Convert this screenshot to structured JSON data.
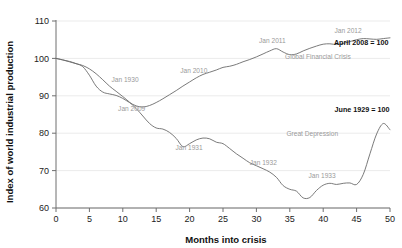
{
  "chart_data": {
    "type": "line",
    "title": "",
    "xlabel": "Months into crisis",
    "ylabel": "Index of world industrial production",
    "xlim": [
      0,
      50
    ],
    "ylim": [
      60,
      110
    ],
    "grid": true,
    "legend_position": "inline-annotations",
    "xticks": [
      "0",
      "5",
      "10",
      "15",
      "20",
      "25",
      "30",
      "35",
      "40",
      "45",
      "50"
    ],
    "yticks": [
      "60",
      "70",
      "80",
      "90",
      "100",
      "110"
    ],
    "series": [
      {
        "name": "Global Financial Crisis",
        "baseline_label": "April 2008 = 100",
        "color": "#6b6b6b",
        "x": [
          0,
          1,
          2,
          3,
          4,
          5,
          6,
          7,
          8,
          9,
          10,
          11,
          12,
          13,
          14,
          15,
          16,
          17,
          18,
          19,
          20,
          21,
          22,
          23,
          24,
          25,
          26,
          27,
          28,
          29,
          30,
          31,
          32,
          33,
          34,
          35,
          36,
          37,
          38,
          39,
          40,
          41,
          42,
          43,
          44,
          45,
          46,
          47,
          48,
          49,
          50
        ],
        "values": [
          100.0,
          99.6,
          99.2,
          98.6,
          97.8,
          95.5,
          92.6,
          91.0,
          90.5,
          90.1,
          89.3,
          88.2,
          87.3,
          87.0,
          87.4,
          88.2,
          89.2,
          90.3,
          91.4,
          92.6,
          93.7,
          94.8,
          95.7,
          96.3,
          96.9,
          97.6,
          97.9,
          98.4,
          99.1,
          99.7,
          100.4,
          101.2,
          102.0,
          102.6,
          101.7,
          101.0,
          101.2,
          102.0,
          102.7,
          103.3,
          103.8,
          103.9,
          103.7,
          104.0,
          104.5,
          105.0,
          105.3,
          105.2,
          105.1,
          105.3,
          105.5
        ]
      },
      {
        "name": "Great Depression",
        "baseline_label": "June 1929 = 100",
        "color": "#6b6b6b",
        "x": [
          0,
          1,
          2,
          3,
          4,
          5,
          6,
          7,
          8,
          9,
          10,
          11,
          12,
          13,
          14,
          15,
          16,
          17,
          18,
          19,
          20,
          21,
          22,
          23,
          24,
          25,
          26,
          27,
          28,
          29,
          30,
          31,
          32,
          33,
          34,
          35,
          36,
          37,
          38,
          39,
          40,
          41,
          42,
          43,
          44,
          45,
          46,
          47,
          48,
          49,
          50
        ],
        "values": [
          100.0,
          99.6,
          99.1,
          98.6,
          98.1,
          97.2,
          95.9,
          94.3,
          92.6,
          91.2,
          89.8,
          88.3,
          86.6,
          84.6,
          82.6,
          81.4,
          81.1,
          80.2,
          78.6,
          76.4,
          77.2,
          78.2,
          78.7,
          78.5,
          77.6,
          77.2,
          75.9,
          74.5,
          73.3,
          72.1,
          71.3,
          70.5,
          69.6,
          68.2,
          66.0,
          65.0,
          64.5,
          62.7,
          62.8,
          64.7,
          66.1,
          66.6,
          66.3,
          66.6,
          66.7,
          66.3,
          69.0,
          74.5,
          79.8,
          82.6,
          80.9
        ]
      }
    ],
    "annotations": [
      {
        "text": "Jan 1930",
        "x": 8.3,
        "y": 93.6,
        "style": "series-label"
      },
      {
        "text": "Jan 1931",
        "x": 17.9,
        "y": 75.5,
        "style": "series-label"
      },
      {
        "text": "Jan 1932",
        "x": 29.0,
        "y": 71.4,
        "style": "series-label"
      },
      {
        "text": "Jan 1933",
        "x": 37.8,
        "y": 68.0,
        "style": "series-label"
      },
      {
        "text": "Jan 2009",
        "x": 9.3,
        "y": 85.9,
        "style": "series-label"
      },
      {
        "text": "Jan 2010",
        "x": 18.6,
        "y": 96.1,
        "style": "series-label"
      },
      {
        "text": "Jan 2011",
        "x": 30.4,
        "y": 104.0,
        "style": "series-label"
      },
      {
        "text": "Jan 2012",
        "x": 41.7,
        "y": 106.8,
        "style": "series-label"
      },
      {
        "text": "Global Financial Crisis",
        "x": 34.3,
        "y": 99.8,
        "style": "series-label"
      },
      {
        "text": "Great Depression",
        "x": 34.5,
        "y": 79.2,
        "style": "series-label"
      },
      {
        "text": "April 2008 = 100",
        "x": 41.6,
        "y": 103.6,
        "style": "endpoint-label"
      },
      {
        "text": "June 1929 = 100",
        "x": 41.7,
        "y": 85.6,
        "style": "endpoint-label"
      }
    ]
  }
}
